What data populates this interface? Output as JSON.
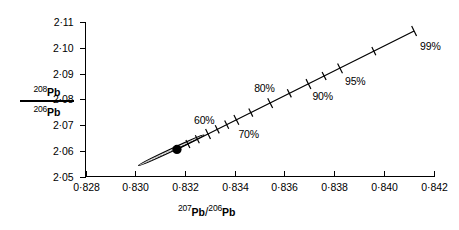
{
  "chart_data": {
    "type": "scatter",
    "title": "",
    "xlabel": "207Pb/206Pb",
    "ylabel": "208Pb/206Pb",
    "xlim": [
      0.828,
      0.842
    ],
    "ylim": [
      2.05,
      2.11
    ],
    "grid": false,
    "legend": "none",
    "x_ticks": [
      "0·828",
      "0·830",
      "0·832",
      "0·834",
      "0·836",
      "0·838",
      "0·840",
      "0·842"
    ],
    "x_tick_values": [
      0.828,
      0.83,
      0.832,
      0.834,
      0.836,
      0.838,
      0.84,
      0.842
    ],
    "y_ticks": [
      "2·05",
      "2·06",
      "2·07",
      "2·08",
      "2·09",
      "2·10",
      "2·11"
    ],
    "y_tick_values": [
      2.05,
      2.06,
      2.07,
      2.08,
      2.09,
      2.1,
      2.11
    ],
    "series": [
      {
        "name": "sample",
        "type": "point",
        "x": [
          0.83168
        ],
        "y": [
          2.0605
        ],
        "marker": "filled-circle",
        "color": "#000000"
      },
      {
        "name": "error-ellipse",
        "type": "ellipse",
        "center_x": 0.83145,
        "center_y": 2.0602,
        "semi_major": 0.00145,
        "semi_minor": 0.00052,
        "angle_deg": 25,
        "fill": "stipple",
        "color": "#000000"
      },
      {
        "name": "mixing-line",
        "type": "line",
        "x": [
          0.83168,
          0.84122
        ],
        "y": [
          2.0605,
          2.1065
        ],
        "color": "#000000",
        "annotations": [
          {
            "label": "60%",
            "x": 0.83293,
            "y": 2.0665,
            "label_dx": -14,
            "label_dy": -19
          },
          {
            "label": "70%",
            "x": 0.83407,
            "y": 2.072,
            "label_dx": 2,
            "label_dy": 9
          },
          {
            "label": "80%",
            "x": 0.83543,
            "y": 2.0785,
            "label_dx": -16,
            "label_dy": -20
          },
          {
            "label": "90%",
            "x": 0.83697,
            "y": 2.0859,
            "label_dx": 4,
            "label_dy": 7
          },
          {
            "label": "95%",
            "x": 0.83824,
            "y": 2.092,
            "label_dx": 5,
            "label_dy": 8
          },
          {
            "label": "99%",
            "x": 0.84122,
            "y": 2.1065,
            "label_dx": 6,
            "label_dy": 10
          }
        ],
        "minor_ticks_x": [
          0.83212,
          0.8325,
          0.8333,
          0.83368,
          0.83465,
          0.8362,
          0.8376,
          0.8396
        ]
      }
    ]
  },
  "axis_titles": {
    "y": {
      "numerator_sup": "208",
      "numerator_el": "Pb",
      "denominator_sup": "206",
      "denominator_el": "Pb"
    },
    "x": {
      "numerator_sup": "207",
      "numerator_el": "Pb",
      "slash": "/",
      "denominator_sup": "206",
      "denominator_el": "Pb"
    }
  }
}
